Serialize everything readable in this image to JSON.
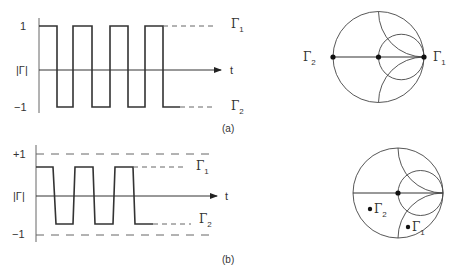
{
  "panels": [
    {
      "id": "a",
      "caption": "(a)",
      "waveform": {
        "y_axis_label": "|Γ|",
        "x_axis_label": "t",
        "tick_top": "1",
        "tick_bottom": "−1",
        "level_top_label": "Γ",
        "level_top_sub": "1",
        "level_bottom_label": "Γ",
        "level_bottom_sub": "2"
      },
      "smith": {
        "point_left_label": "Γ",
        "point_left_sub": "2",
        "point_right_label": "Γ",
        "point_right_sub": "1"
      }
    },
    {
      "id": "b",
      "caption": "(b)",
      "waveform": {
        "y_axis_label": "|Γ|",
        "x_axis_label": "t",
        "tick_top": "+1",
        "tick_bottom": "−1",
        "level_top_label": "Γ",
        "level_top_sub": "1",
        "level_bottom_label": "Γ",
        "level_bottom_sub": "2"
      },
      "smith": {
        "point_a_label": "Γ",
        "point_a_sub": "2",
        "point_b_label": "Γ",
        "point_b_sub": "1"
      }
    }
  ],
  "colors": {
    "stroke": "#333333",
    "axis": "#555555",
    "background": "#ffffff"
  }
}
